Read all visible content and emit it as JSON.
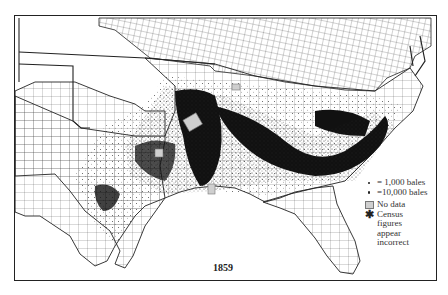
{
  "map": {
    "year": "1859",
    "legend": {
      "items": [
        {
          "symbol": "small-dot",
          "label": "= 1,000 bales"
        },
        {
          "symbol": "large-dot",
          "label": "=10,000 bales"
        },
        {
          "symbol": "gray-square",
          "label": "No data"
        },
        {
          "symbol": "asterisk",
          "label": "Census figures appear incorrect"
        }
      ],
      "census_lines": [
        "Census",
        "figures",
        "appear",
        "incorrect"
      ]
    },
    "colors": {
      "ink": "#222222",
      "no_data": "#cfcfcf",
      "background": "#ffffff"
    }
  }
}
